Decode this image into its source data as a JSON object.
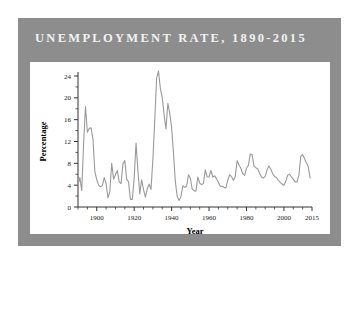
{
  "figure": {
    "title": "UNEMPLOYMENT RATE, 1890-2015",
    "frame_color": "#8d8d8d",
    "card_color": "#ffffff",
    "title_color": "#f2f2f2"
  },
  "chart_data": {
    "type": "line",
    "title": "UNEMPLOYMENT RATE, 1890-2015",
    "xlabel": "Year",
    "ylabel": "Percentage",
    "xlim": [
      1890,
      2015
    ],
    "ylim": [
      0,
      24
    ],
    "grid": false,
    "legend": null,
    "line_color": "#9a9a9a",
    "x_ticks": [
      1900,
      1920,
      1940,
      1960,
      1980,
      2000,
      2015
    ],
    "x_tick_labels": [
      "1900",
      "1920",
      "1940",
      "1960",
      "1980",
      "2000",
      "2015"
    ],
    "x_minor_step": 5,
    "y_ticks": [
      0,
      4,
      8,
      12,
      16,
      20,
      24
    ],
    "y_tick_labels": [
      "0",
      "4",
      "8",
      "12",
      "16",
      "20",
      "24"
    ],
    "y_minor_step": 2,
    "x": [
      1890,
      1891,
      1892,
      1893,
      1894,
      1895,
      1896,
      1897,
      1898,
      1899,
      1900,
      1901,
      1902,
      1903,
      1904,
      1905,
      1906,
      1907,
      1908,
      1909,
      1910,
      1911,
      1912,
      1913,
      1914,
      1915,
      1916,
      1917,
      1918,
      1919,
      1920,
      1921,
      1922,
      1923,
      1924,
      1925,
      1926,
      1927,
      1928,
      1929,
      1930,
      1931,
      1932,
      1933,
      1934,
      1935,
      1936,
      1937,
      1938,
      1939,
      1940,
      1941,
      1942,
      1943,
      1944,
      1945,
      1946,
      1947,
      1948,
      1949,
      1950,
      1951,
      1952,
      1953,
      1954,
      1955,
      1956,
      1957,
      1958,
      1959,
      1960,
      1961,
      1962,
      1963,
      1964,
      1965,
      1966,
      1967,
      1968,
      1969,
      1970,
      1971,
      1972,
      1973,
      1974,
      1975,
      1976,
      1977,
      1978,
      1979,
      1980,
      1981,
      1982,
      1983,
      1984,
      1985,
      1986,
      1987,
      1988,
      1989,
      1990,
      1991,
      1992,
      1993,
      1994,
      1995,
      1996,
      1997,
      1998,
      1999,
      2000,
      2001,
      2002,
      2003,
      2004,
      2005,
      2006,
      2007,
      2008,
      2009,
      2010,
      2011,
      2012,
      2013,
      2014
    ],
    "values": [
      4.0,
      5.4,
      3.0,
      11.7,
      18.4,
      13.7,
      14.4,
      14.5,
      12.4,
      6.5,
      5.0,
      4.0,
      3.7,
      3.9,
      5.4,
      4.3,
      1.7,
      2.8,
      8.0,
      5.1,
      5.9,
      6.7,
      4.6,
      4.3,
      7.9,
      8.5,
      5.1,
      4.6,
      1.4,
      1.4,
      5.2,
      11.7,
      6.7,
      2.4,
      5.0,
      3.2,
      1.8,
      3.3,
      4.2,
      3.2,
      8.7,
      15.9,
      23.6,
      24.9,
      21.7,
      20.1,
      16.9,
      14.3,
      19.0,
      17.2,
      14.6,
      9.9,
      4.7,
      1.9,
      1.2,
      1.9,
      3.9,
      3.6,
      3.8,
      5.9,
      5.3,
      3.3,
      3.0,
      2.9,
      5.5,
      4.4,
      4.1,
      4.3,
      6.8,
      5.5,
      5.5,
      6.7,
      5.5,
      5.7,
      5.2,
      4.5,
      3.8,
      3.8,
      3.6,
      3.5,
      4.9,
      5.9,
      5.6,
      4.9,
      5.6,
      8.5,
      7.7,
      7.1,
      6.1,
      5.8,
      7.1,
      7.6,
      9.7,
      9.6,
      7.5,
      7.2,
      7.0,
      6.2,
      5.5,
      5.3,
      5.6,
      6.8,
      7.5,
      6.9,
      6.1,
      5.6,
      5.4,
      4.9,
      4.5,
      4.2,
      4.0,
      4.7,
      5.8,
      6.0,
      5.5,
      5.1,
      4.6,
      4.6,
      5.8,
      9.3,
      9.6,
      8.9,
      8.1,
      7.4,
      5.3
    ]
  }
}
